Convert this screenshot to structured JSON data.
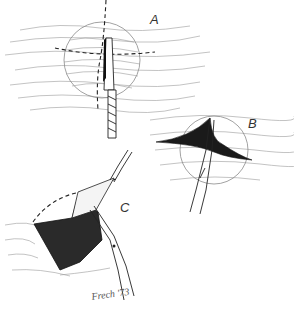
{
  "figure": {
    "type": "surgical-technique-illustration",
    "panels": [
      {
        "id": "A",
        "label": "A",
        "description": "Circular lesion with dashed cruciate incision lines and scalpel blade incising vertically"
      },
      {
        "id": "B",
        "label": "B",
        "description": "Cruciate incision opened with scissors, flaps spreading"
      },
      {
        "id": "C",
        "label": "C",
        "description": "Flap retracted with forceps and undermined with scissors exposing dark cavity"
      }
    ],
    "signature": "Frech '73",
    "colors": {
      "background": "#ffffff",
      "ink": "#222222",
      "hatching": "#9a9a9a",
      "cavity": "#2a2a2a"
    }
  }
}
